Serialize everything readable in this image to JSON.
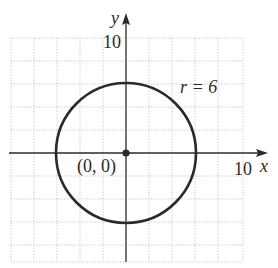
{
  "diagram": {
    "axes": {
      "x_label": "x",
      "y_label": "y",
      "x_tick_label": "10",
      "y_tick_label": "10",
      "x_range": [
        -10,
        10
      ],
      "y_range": [
        -10,
        10
      ],
      "grid_step": 2
    },
    "circle": {
      "center": [
        0,
        0
      ],
      "radius": 6,
      "radius_label": "r = 6"
    },
    "center_point": {
      "coords": [
        0,
        0
      ],
      "label": "(0, 0)"
    },
    "colors": {
      "stroke": "#2a2a2a",
      "grid": "#b8b8b8",
      "background": "#ffffff"
    }
  }
}
